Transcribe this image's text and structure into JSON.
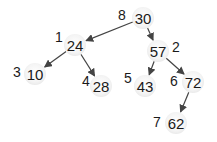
{
  "diagram": {
    "type": "binary-tree",
    "nodes": [
      {
        "id": "n30",
        "value": "30",
        "order": "8",
        "x": 143,
        "y": 18,
        "lx": 118,
        "ly": 8
      },
      {
        "id": "n24",
        "value": "24",
        "order": "1",
        "x": 75,
        "y": 45,
        "lx": 55,
        "ly": 30
      },
      {
        "id": "n57",
        "value": "57",
        "order": "2",
        "x": 158,
        "y": 51,
        "lx": 172,
        "ly": 40
      },
      {
        "id": "n10",
        "value": "10",
        "order": "3",
        "x": 35,
        "y": 74,
        "lx": 13,
        "ly": 65
      },
      {
        "id": "n28",
        "value": "28",
        "order": "4",
        "x": 101,
        "y": 86,
        "lx": 82,
        "ly": 74
      },
      {
        "id": "n43",
        "value": "43",
        "order": "5",
        "x": 145,
        "y": 86,
        "lx": 124,
        "ly": 71
      },
      {
        "id": "n72",
        "value": "72",
        "order": "6",
        "x": 193,
        "y": 82,
        "lx": 170,
        "ly": 74
      },
      {
        "id": "n62",
        "value": "62",
        "order": "7",
        "x": 176,
        "y": 123,
        "lx": 153,
        "ly": 115
      }
    ],
    "edges": [
      {
        "from": "n30",
        "to": "n24"
      },
      {
        "from": "n30",
        "to": "n57"
      },
      {
        "from": "n24",
        "to": "n10"
      },
      {
        "from": "n24",
        "to": "n28"
      },
      {
        "from": "n57",
        "to": "n43"
      },
      {
        "from": "n57",
        "to": "n72"
      },
      {
        "from": "n72",
        "to": "n62"
      }
    ],
    "colors": {
      "edge": "#444444",
      "text": "#1a1a1a"
    }
  }
}
